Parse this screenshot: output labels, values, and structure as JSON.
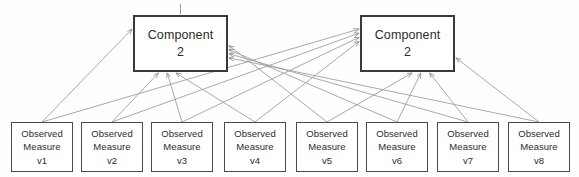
{
  "diagram": {
    "type": "path-diagram",
    "canvas": {
      "width": 579,
      "height": 177
    },
    "colors": {
      "background": "#fefefe",
      "component_border": "#3a3a3a",
      "observed_border": "#4a4a4a",
      "edge_line": "#9a9a9a",
      "text": "#2b2b2b"
    },
    "components": [
      {
        "id": "component-left",
        "label_line1": "Component",
        "label_line2": "2",
        "x": 133,
        "y": 15,
        "width": 95,
        "height": 57
      },
      {
        "id": "component-right",
        "label_line1": "Component",
        "label_line2": "2",
        "x": 360,
        "y": 15,
        "width": 95,
        "height": 57
      }
    ],
    "observed": [
      {
        "id": "v1",
        "label_line1": "Observed",
        "label_line2": "Measure",
        "label_line3": "v1",
        "x": 11,
        "y": 122,
        "width": 62,
        "height": 50
      },
      {
        "id": "v2",
        "label_line1": "Observed",
        "label_line2": "Measure",
        "label_line3": "v2",
        "x": 81,
        "y": 122,
        "width": 62,
        "height": 50
      },
      {
        "id": "v3",
        "label_line1": "Observed",
        "label_line2": "Measure",
        "label_line3": "v3",
        "x": 151,
        "y": 122,
        "width": 62,
        "height": 50
      },
      {
        "id": "v4",
        "label_line1": "Observed",
        "label_line2": "Measure",
        "label_line3": "v4",
        "x": 224,
        "y": 122,
        "width": 62,
        "height": 50
      },
      {
        "id": "v5",
        "label_line1": "Observed",
        "label_line2": "Measure",
        "label_line3": "v5",
        "x": 296,
        "y": 122,
        "width": 62,
        "height": 50
      },
      {
        "id": "v6",
        "label_line1": "Observed",
        "label_line2": "Measure",
        "label_line3": "v6",
        "x": 366,
        "y": 122,
        "width": 62,
        "height": 50
      },
      {
        "id": "v7",
        "label_line1": "Observed",
        "label_line2": "Measure",
        "label_line3": "v7",
        "x": 437,
        "y": 122,
        "width": 62,
        "height": 50
      },
      {
        "id": "v8",
        "label_line1": "Observed",
        "label_line2": "Measure",
        "label_line3": "v8",
        "x": 508,
        "y": 122,
        "width": 62,
        "height": 50
      }
    ],
    "edges_note": "Every observed measure connects by arrow to both component boxes; arrowheads terminate on the component boxes."
  }
}
